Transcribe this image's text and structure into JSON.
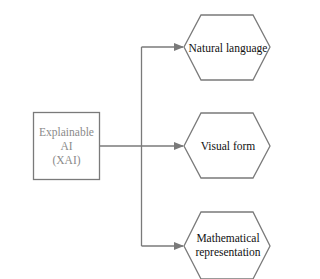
{
  "diagram": {
    "source": {
      "line1": "Explainable AI",
      "line2": "(XAI)"
    },
    "targets": [
      {
        "label": "Natural language"
      },
      {
        "label": "Visual form"
      },
      {
        "label_line1": "Mathematical",
        "label_line2": "representation"
      }
    ],
    "colors": {
      "stroke": "#7a7a7a",
      "source_text": "#8a8a8a",
      "target_text": "#111111",
      "background": "#ffffff"
    }
  }
}
